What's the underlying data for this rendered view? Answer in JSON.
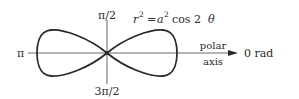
{
  "diagram": {
    "equation": {
      "lhs_var": "r",
      "lhs_exp": "2",
      "eq": "=",
      "a_var": "a",
      "a_exp": "2",
      "rest": "cos 2",
      "theta": "θ"
    },
    "angle_labels": {
      "top": "π/2",
      "bottom": "3π/2",
      "left": "π",
      "right": "0 rad"
    },
    "axis_label": {
      "line1": "polar",
      "line2": "axis"
    },
    "colors": {
      "stroke": "#2a2a2a",
      "axis": "#6a6a6a",
      "background": "#ffffff"
    }
  }
}
